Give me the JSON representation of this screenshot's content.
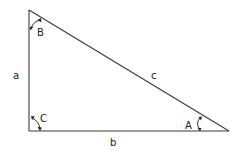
{
  "diagram": {
    "type": "right-triangle",
    "colors": {
      "line": "#3a3a3a",
      "text": "#222222",
      "background": "#ffffff"
    },
    "vertices": {
      "B": {
        "x": 29,
        "y": 10
      },
      "C": {
        "x": 29,
        "y": 131
      },
      "A": {
        "x": 229,
        "y": 131
      }
    },
    "sides": {
      "a": {
        "label": "a",
        "from": "B",
        "to": "C"
      },
      "b": {
        "label": "b",
        "from": "C",
        "to": "A"
      },
      "c": {
        "label": "c",
        "from": "B",
        "to": "A"
      }
    },
    "angles": {
      "A": {
        "label": "A"
      },
      "B": {
        "label": "B"
      },
      "C": {
        "label": "C"
      }
    }
  }
}
